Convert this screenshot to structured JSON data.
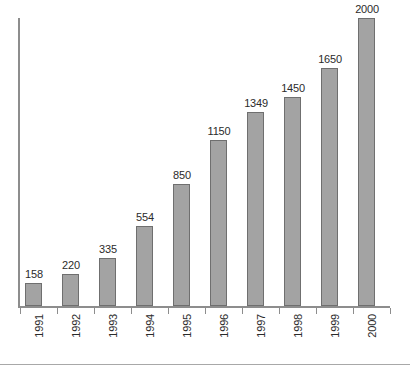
{
  "chart_data": {
    "type": "bar",
    "title": "",
    "subtitle": "",
    "xlabel": "",
    "ylabel": "",
    "categories": [
      "1991",
      "1992",
      "1993",
      "1994",
      "1995",
      "1996",
      "1997",
      "1998",
      "1999",
      "2000"
    ],
    "values": [
      158,
      220,
      335,
      554,
      850,
      1150,
      1349,
      1450,
      1650,
      2000
    ],
    "data_labels": [
      "158",
      "220",
      "335",
      "554",
      "850",
      "1150",
      "1349",
      "1450",
      "1650",
      "2000"
    ],
    "series": [
      {
        "name": "",
        "values": [
          158,
          220,
          335,
          554,
          850,
          1150,
          1349,
          1450,
          1650,
          2000
        ]
      }
    ],
    "ylim": [
      0,
      2000
    ],
    "grid": false,
    "legend": false,
    "legend_position": "none",
    "y_tick_labels": [],
    "annotations": [],
    "bar_color": "#a3a3a3",
    "bar_border_color": "#6f6f6f",
    "axis_color": "#8d8d8d",
    "text_color": "#2b2b2b",
    "background_color": "#ffffff"
  }
}
